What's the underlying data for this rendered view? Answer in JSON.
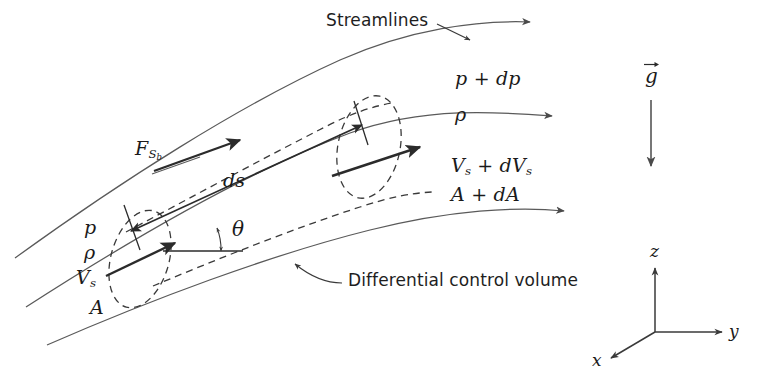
{
  "figure": {
    "caption_title": "Differential control volume for momentum analysis of flow through a stream tube",
    "labels": {
      "streamlines": "Streamlines",
      "differential_control_volume": "Differential control volume",
      "pressure_inlet": "p",
      "density_inlet": "ρ",
      "velocity_inlet": "V",
      "velocity_inlet_sub": "s",
      "area_inlet": "A",
      "pressure_outlet_base": "p",
      "pressure_outlet_delta": "dp",
      "density_outlet": "ρ",
      "velocity_outlet_base": "V",
      "velocity_outlet_sub": "s",
      "velocity_outlet_delta": "dV",
      "velocity_outlet_delta_sub": "s",
      "area_outlet_base": "A",
      "area_outlet_delta": "dA",
      "plus_sign": "+",
      "arc_length": "ds",
      "angle_theta": "θ",
      "surface_force": "F",
      "surface_force_sub": "S",
      "surface_force_subsub": "b",
      "gravity": "g"
    },
    "axes": {
      "x": "x",
      "y": "y",
      "z": "z"
    },
    "colors": {
      "stroke": "#4a4a4a",
      "stroke_dark": "#2b2b2b",
      "text": "#1a1a1a",
      "background": "#ffffff"
    }
  }
}
